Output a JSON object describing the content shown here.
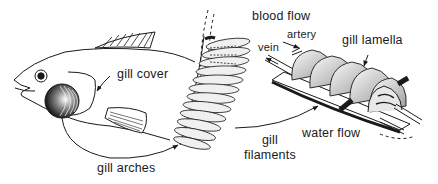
{
  "diagram": {
    "ink_color": "#1a1a1a",
    "background": "#ffffff",
    "labels": {
      "gill_cover": "gill cover",
      "gill_arches": "gill arches",
      "blood_flow": "blood flow",
      "artery": "artery",
      "vein": "vein",
      "gill_lamella": "gill lamella",
      "gill_filaments_line1": "gill",
      "gill_filaments_line2": "filaments",
      "water_flow": "water flow"
    },
    "parts": [
      {
        "id": "fish-head",
        "label": "fish head with gill cover"
      },
      {
        "id": "gill-arch-detail",
        "label": "gill arch with filaments"
      },
      {
        "id": "filament-detail",
        "label": "gill filament with lamellae, artery and vein"
      }
    ]
  }
}
